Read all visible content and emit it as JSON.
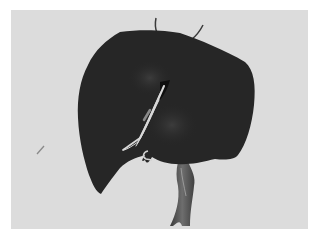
{
  "image": {
    "subject": "3D rendering of a liver with vessels",
    "background_color": "#dcdcdc",
    "border_color": "#ffffff",
    "organ_color": "#262626",
    "vessel_color": "#5a5a5a",
    "highlight_color": "#d8d8d8"
  }
}
